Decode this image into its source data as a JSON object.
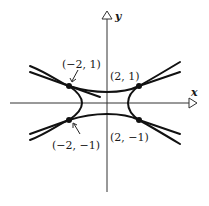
{
  "figure": {
    "axes": {
      "x_label": "x",
      "y_label": "y"
    },
    "points": [
      {
        "label": "(−2, 1)",
        "x": -2,
        "y": 1
      },
      {
        "label": "(2, 1)",
        "x": 2,
        "y": 1
      },
      {
        "label": "(−2, −1)",
        "x": -2,
        "y": -1
      },
      {
        "label": "(2, −1)",
        "x": 2,
        "y": -1
      }
    ],
    "colors": {
      "ink": "#1a1a1a",
      "background": "#ffffff"
    }
  }
}
